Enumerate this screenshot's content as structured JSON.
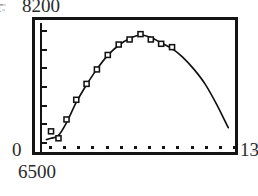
{
  "figure": {
    "labels": {
      "top_left_value": "8200",
      "corner_glyph": "r",
      "origin_value": "0",
      "bottom_left_value": "6500",
      "bottom_right_value": "13"
    },
    "frame": {
      "border_color": "#141414"
    },
    "ink_color": "#111111"
  },
  "chart_data": {
    "type": "scatter",
    "title": "",
    "subtitle": "",
    "xlabel": "",
    "ylabel": "",
    "xlim": [
      6500,
      13000
    ],
    "ylim": [
      0,
      8200
    ],
    "grid": false,
    "legend": null,
    "axis_corner_labels": {
      "y_max": "8200",
      "y_min": "0",
      "x_min": "6500",
      "x_max": "13"
    },
    "x_tick_count": 14,
    "y_tick_count": 7,
    "series": [
      {
        "name": "measured",
        "marker": "open-square",
        "x": [
          6720,
          6980,
          7260,
          7600,
          7960,
          8320,
          8700,
          9080,
          9460,
          9840,
          10200,
          10560,
          10940
        ],
        "y": [
          900,
          420,
          1720,
          3080,
          4180,
          5180,
          6180,
          6900,
          7250,
          7620,
          7250,
          6950,
          6720
        ]
      },
      {
        "name": "fit",
        "marker": "none",
        "type": "line",
        "x": [
          6560,
          6720,
          6980,
          7260,
          7600,
          7960,
          8320,
          8700,
          9080,
          9460,
          9840,
          10200,
          10560,
          10940,
          11300,
          11700,
          12100,
          12500,
          12900
        ],
        "y": [
          330,
          420,
          620,
          1500,
          2900,
          4120,
          5200,
          6150,
          6850,
          7320,
          7560,
          7380,
          7020,
          6620,
          6050,
          5200,
          4150,
          2750,
          1150
        ]
      }
    ]
  }
}
